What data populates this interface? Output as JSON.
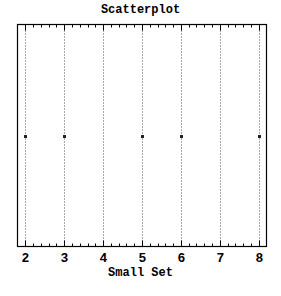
{
  "chart_data": {
    "type": "scatter",
    "title": "Scatterplot",
    "xlabel": "Small Set",
    "ylabel": "",
    "xlim": [
      1.8,
      8.2
    ],
    "x_ticks": [
      2,
      3,
      4,
      5,
      6,
      7,
      8
    ],
    "x_tick_labels": [
      "2",
      "3",
      "4",
      "5",
      "6",
      "7",
      "8"
    ],
    "minor_ticks_per_interval": 4,
    "grid": "vertical dotted lines at major ticks",
    "legend": "none",
    "points": [
      {
        "x": 2,
        "y": 0
      },
      {
        "x": 3,
        "y": 0
      },
      {
        "x": 5,
        "y": 0
      },
      {
        "x": 6,
        "y": 0
      },
      {
        "x": 8,
        "y": 0
      }
    ],
    "x": [
      2,
      3,
      5,
      6,
      8
    ]
  },
  "colors": {
    "background": "#ffffff",
    "axis": "#000000",
    "grid": "#555555",
    "marker": "#222222"
  }
}
